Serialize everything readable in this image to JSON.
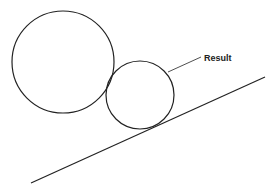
{
  "diagram": {
    "labels": {
      "result": "Result"
    },
    "shapes": {
      "large_circle": {
        "cx": 63,
        "cy": 62,
        "r": 51
      },
      "small_circle": {
        "cx": 140,
        "cy": 95,
        "r": 34
      },
      "slope_line": {
        "x1": 31,
        "y1": 183,
        "x2": 265,
        "y2": 77
      },
      "leader_line": {
        "x1": 168,
        "y1": 72,
        "x2": 201,
        "y2": 57
      }
    },
    "colors": {
      "stroke": "#222222",
      "background": "#ffffff"
    }
  }
}
